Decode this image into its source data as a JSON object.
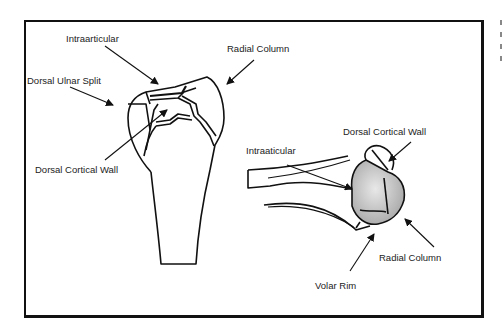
{
  "figure": {
    "left_view": {
      "labels": {
        "intraarticular": "Intraarticular",
        "radial_column": "Radial Column",
        "dorsal_ulnar_split": "Dorsal Ulnar Split",
        "dorsal_cortical_wall": "Dorsal Cortical Wall"
      }
    },
    "right_view": {
      "labels": {
        "dorsal_cortical_wall": "Dorsal Cortical Wall",
        "intraarticular": "Intraaticular",
        "radial_column": "Radial Column",
        "volar_rim": "Volar Rim"
      }
    }
  },
  "colors": {
    "line": "#111111",
    "frame": "#111111",
    "fill_shade": "#c8c8c8",
    "background": "#ffffff"
  }
}
